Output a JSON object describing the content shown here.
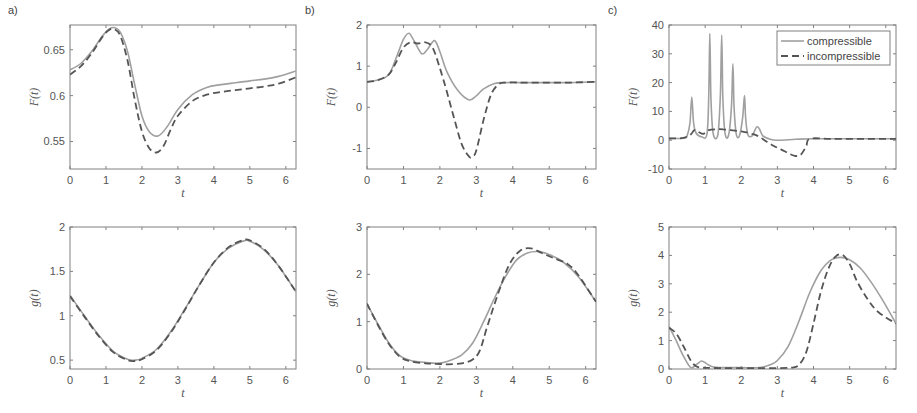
{
  "figure": {
    "panel_labels": [
      "a)",
      "b)",
      "c)"
    ],
    "legend": {
      "entries": [
        "compressible",
        "incompressible"
      ]
    },
    "colors": {
      "compressible": "#a0a0a0",
      "incompressible": "#555555",
      "axes": "#808080",
      "text": "#555555"
    }
  },
  "chart_data": [
    {
      "id": "a-top",
      "panel": "a)",
      "type": "line",
      "xlabel": "t",
      "ylabel": "F(t)",
      "frame": [
        70,
        25,
        296,
        169
      ],
      "xlim": [
        0,
        6.283
      ],
      "ylim": [
        0.52,
        0.677
      ],
      "xticks": [
        0,
        1,
        2,
        3,
        4,
        5,
        6
      ],
      "yticks": [
        0.55,
        0.6,
        0.65
      ],
      "ytick_labels": [
        "0.55",
        "0.6",
        "0.65"
      ],
      "series": [
        {
          "name": "compressible",
          "style": "solid",
          "x": [
            0,
            0.3,
            0.6,
            0.9,
            1.1,
            1.25,
            1.4,
            1.6,
            1.8,
            2.0,
            2.2,
            2.45,
            2.7,
            3.0,
            3.4,
            3.8,
            4.2,
            4.6,
            5.0,
            5.4,
            5.8,
            6.283
          ],
          "y": [
            0.628,
            0.635,
            0.648,
            0.665,
            0.673,
            0.674,
            0.669,
            0.648,
            0.612,
            0.578,
            0.561,
            0.556,
            0.566,
            0.585,
            0.601,
            0.609,
            0.612,
            0.614,
            0.616,
            0.618,
            0.621,
            0.627
          ]
        },
        {
          "name": "incompressible",
          "style": "dashed",
          "x": [
            0,
            0.3,
            0.6,
            0.9,
            1.1,
            1.25,
            1.4,
            1.6,
            1.8,
            2.0,
            2.2,
            2.4,
            2.6,
            2.8,
            3.0,
            3.4,
            3.8,
            4.2,
            4.6,
            5.0,
            5.4,
            5.8,
            6.283
          ],
          "y": [
            0.623,
            0.632,
            0.646,
            0.664,
            0.672,
            0.672,
            0.665,
            0.638,
            0.596,
            0.561,
            0.543,
            0.538,
            0.545,
            0.563,
            0.578,
            0.594,
            0.601,
            0.604,
            0.606,
            0.608,
            0.61,
            0.613,
            0.62
          ]
        }
      ]
    },
    {
      "id": "b-top",
      "panel": "b)",
      "type": "line",
      "xlabel": "t",
      "ylabel": "F(t)",
      "frame": [
        367,
        25,
        596,
        169
      ],
      "xlim": [
        0,
        6.283
      ],
      "ylim": [
        -1.5,
        2
      ],
      "xticks": [
        0,
        1,
        2,
        3,
        4,
        5,
        6
      ],
      "yticks": [
        -1,
        0,
        1,
        2
      ],
      "ytick_labels": [
        "-1",
        "0",
        "1",
        "2"
      ],
      "series": [
        {
          "name": "compressible",
          "style": "solid",
          "x": [
            0,
            0.3,
            0.6,
            0.8,
            1.0,
            1.15,
            1.3,
            1.5,
            1.65,
            1.85,
            2.0,
            2.2,
            2.5,
            2.8,
            3.0,
            3.2,
            3.5,
            3.8,
            4.5,
            5.5,
            6.283
          ],
          "y": [
            0.62,
            0.66,
            0.8,
            1.2,
            1.65,
            1.8,
            1.6,
            1.3,
            1.4,
            1.62,
            1.35,
            0.85,
            0.4,
            0.18,
            0.28,
            0.45,
            0.58,
            0.6,
            0.6,
            0.6,
            0.62
          ]
        },
        {
          "name": "incompressible",
          "style": "dashed",
          "x": [
            0,
            0.3,
            0.6,
            0.8,
            1.0,
            1.2,
            1.4,
            1.6,
            1.8,
            2.0,
            2.2,
            2.4,
            2.6,
            2.8,
            2.9,
            3.0,
            3.2,
            3.4,
            3.6,
            3.8,
            4.5,
            5.5,
            6.283
          ],
          "y": [
            0.62,
            0.66,
            0.8,
            1.1,
            1.45,
            1.58,
            1.55,
            1.58,
            1.45,
            0.95,
            0.35,
            -0.3,
            -0.9,
            -1.2,
            -1.2,
            -1.05,
            -0.3,
            0.3,
            0.55,
            0.6,
            0.6,
            0.6,
            0.62
          ]
        }
      ]
    },
    {
      "id": "c-top",
      "panel": "c)",
      "type": "line",
      "xlabel": "t",
      "ylabel": "F(t)",
      "frame": [
        669,
        25,
        896,
        169
      ],
      "xlim": [
        0,
        6.283
      ],
      "ylim": [
        -10,
        40
      ],
      "xticks": [
        0,
        1,
        2,
        3,
        4,
        5,
        6
      ],
      "yticks": [
        -10,
        0,
        10,
        20,
        30,
        40
      ],
      "ytick_labels": [
        "-10",
        "0",
        "10",
        "20",
        "30",
        "40"
      ],
      "legend": {
        "position": "upper right"
      },
      "series": [
        {
          "name": "compressible",
          "style": "solid",
          "x": [
            0,
            0.4,
            0.5,
            0.58,
            0.63,
            0.68,
            0.75,
            0.9,
            1.05,
            1.1,
            1.13,
            1.16,
            1.22,
            1.35,
            1.42,
            1.46,
            1.49,
            1.55,
            1.65,
            1.73,
            1.77,
            1.8,
            1.86,
            1.95,
            2.04,
            2.09,
            2.12,
            2.18,
            2.3,
            2.42,
            2.5,
            2.6,
            2.8,
            3.0,
            3.5,
            4.0,
            5.0,
            6.283
          ],
          "y": [
            0.6,
            0.7,
            1.5,
            6,
            15,
            6,
            2.5,
            1.2,
            2,
            15,
            37,
            15,
            2.5,
            1.8,
            15,
            36.5,
            15,
            2.5,
            1.8,
            12,
            26.5,
            12,
            2.2,
            1.6,
            8,
            15.5,
            8,
            2,
            1.5,
            4.5,
            4,
            1.5,
            0.3,
            0,
            0.3,
            0.5,
            0.5,
            0.5
          ]
        },
        {
          "name": "incompressible",
          "style": "dashed",
          "x": [
            0,
            0.4,
            0.6,
            0.7,
            0.8,
            0.95,
            1.1,
            1.3,
            1.5,
            1.7,
            1.9,
            2.1,
            2.3,
            2.5,
            2.7,
            2.9,
            3.1,
            3.3,
            3.5,
            3.65,
            3.8,
            3.9,
            4.5,
            5.5,
            6.283
          ],
          "y": [
            0.6,
            0.8,
            2,
            3.5,
            3,
            2.2,
            3.5,
            3.8,
            3.8,
            3.5,
            3.2,
            2.8,
            2.2,
            1.2,
            -0.5,
            -2,
            -3.2,
            -4.5,
            -5.5,
            -5,
            -2,
            0.5,
            0.5,
            0.5,
            0.5
          ]
        }
      ]
    },
    {
      "id": "a-bottom",
      "panel": "a)",
      "type": "line",
      "xlabel": "t",
      "ylabel": "g(t)",
      "frame": [
        70,
        227,
        296,
        369
      ],
      "xlim": [
        0,
        6.283
      ],
      "ylim": [
        0.4,
        2
      ],
      "xticks": [
        0,
        1,
        2,
        3,
        4,
        5,
        6
      ],
      "yticks": [
        0.5,
        1,
        1.5,
        2
      ],
      "ytick_labels": [
        "0.5",
        "1",
        "1.5",
        "2"
      ],
      "series": [
        {
          "name": "compressible",
          "style": "solid",
          "x": [
            0,
            0.4,
            0.8,
            1.2,
            1.6,
            1.8,
            2.0,
            2.4,
            2.8,
            3.2,
            3.6,
            4.0,
            4.4,
            4.8,
            5.0,
            5.4,
            5.8,
            6.283
          ],
          "y": [
            1.23,
            1.0,
            0.78,
            0.6,
            0.51,
            0.5,
            0.52,
            0.62,
            0.82,
            1.08,
            1.35,
            1.6,
            1.76,
            1.84,
            1.84,
            1.74,
            1.56,
            1.27
          ]
        },
        {
          "name": "incompressible",
          "style": "dashed",
          "x": [
            0,
            0.4,
            0.8,
            1.2,
            1.6,
            1.8,
            2.0,
            2.4,
            2.8,
            3.2,
            3.6,
            4.0,
            4.4,
            4.8,
            5.0,
            5.4,
            5.8,
            6.283
          ],
          "y": [
            1.22,
            0.99,
            0.77,
            0.59,
            0.5,
            0.49,
            0.51,
            0.61,
            0.81,
            1.07,
            1.35,
            1.6,
            1.77,
            1.85,
            1.85,
            1.75,
            1.56,
            1.27
          ]
        }
      ]
    },
    {
      "id": "b-bottom",
      "panel": "b)",
      "type": "line",
      "xlabel": "t",
      "ylabel": "g(t)",
      "frame": [
        367,
        227,
        596,
        369
      ],
      "xlim": [
        0,
        6.283
      ],
      "ylim": [
        0,
        3
      ],
      "xticks": [
        0,
        1,
        2,
        3,
        4,
        5,
        6
      ],
      "yticks": [
        0,
        1,
        2,
        3
      ],
      "ytick_labels": [
        "0",
        "1",
        "2",
        "3"
      ],
      "series": [
        {
          "name": "compressible",
          "style": "solid",
          "x": [
            0,
            0.3,
            0.6,
            0.9,
            1.2,
            1.6,
            1.9,
            2.2,
            2.6,
            2.9,
            3.2,
            3.5,
            3.8,
            4.1,
            4.4,
            4.7,
            5.0,
            5.4,
            5.8,
            6.283
          ],
          "y": [
            1.38,
            0.95,
            0.55,
            0.28,
            0.18,
            0.14,
            0.12,
            0.16,
            0.3,
            0.55,
            1.0,
            1.5,
            1.95,
            2.3,
            2.45,
            2.48,
            2.42,
            2.25,
            1.95,
            1.42
          ]
        },
        {
          "name": "incompressible",
          "style": "dashed",
          "x": [
            0,
            0.3,
            0.6,
            0.9,
            1.2,
            1.6,
            1.9,
            2.2,
            2.6,
            2.9,
            3.1,
            3.3,
            3.6,
            3.9,
            4.2,
            4.5,
            4.8,
            5.1,
            5.5,
            5.8,
            6.283
          ],
          "y": [
            1.38,
            0.93,
            0.53,
            0.26,
            0.16,
            0.12,
            0.11,
            0.1,
            0.12,
            0.2,
            0.4,
            0.9,
            1.6,
            2.2,
            2.5,
            2.55,
            2.45,
            2.35,
            2.22,
            1.98,
            1.42
          ]
        }
      ]
    },
    {
      "id": "c-bottom",
      "panel": "c)",
      "type": "line",
      "xlabel": "t",
      "ylabel": "g(t)",
      "frame": [
        669,
        227,
        896,
        369
      ],
      "xlim": [
        0,
        6.283
      ],
      "ylim": [
        0,
        5
      ],
      "xticks": [
        0,
        1,
        2,
        3,
        4,
        5,
        6
      ],
      "yticks": [
        0,
        1,
        2,
        3,
        4,
        5
      ],
      "ytick_labels": [
        "0",
        "1",
        "2",
        "3",
        "4",
        "5"
      ],
      "series": [
        {
          "name": "compressible",
          "style": "solid",
          "x": [
            0,
            0.2,
            0.4,
            0.6,
            0.75,
            0.9,
            1.05,
            1.2,
            1.5,
            2.0,
            2.5,
            2.8,
            3.0,
            3.3,
            3.6,
            3.9,
            4.2,
            4.5,
            4.75,
            5.0,
            5.3,
            5.6,
            5.9,
            6.283
          ],
          "y": [
            1.5,
            1.0,
            0.45,
            0.05,
            0.15,
            0.28,
            0.18,
            0.08,
            0.05,
            0.05,
            0.05,
            0.15,
            0.3,
            0.8,
            1.7,
            2.7,
            3.45,
            3.85,
            3.93,
            3.85,
            3.55,
            3.05,
            2.45,
            1.6
          ]
        },
        {
          "name": "incompressible",
          "style": "dashed",
          "x": [
            0,
            0.2,
            0.4,
            0.6,
            0.75,
            0.9,
            1.1,
            1.5,
            2.0,
            2.5,
            3.0,
            3.4,
            3.6,
            3.8,
            4.0,
            4.2,
            4.4,
            4.6,
            4.8,
            5.0,
            5.2,
            5.5,
            5.8,
            6.283
          ],
          "y": [
            1.45,
            1.25,
            0.8,
            0.3,
            0.1,
            0.05,
            0.04,
            0.03,
            0.03,
            0.03,
            0.03,
            0.05,
            0.15,
            0.6,
            1.6,
            2.7,
            3.5,
            3.95,
            4.02,
            3.7,
            3.1,
            2.45,
            2.0,
            1.6
          ]
        }
      ]
    }
  ]
}
